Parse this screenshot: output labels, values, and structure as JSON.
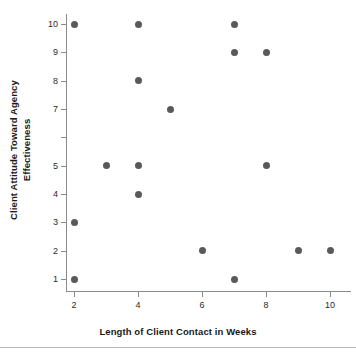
{
  "chart_data": {
    "type": "scatter",
    "title": "",
    "xlabel": "Length of Client Contact in Weeks",
    "ylabel_line1": "Client Attitude Toward Agency",
    "ylabel_line2": "Effectiveness",
    "xlim": [
      1.4,
      10.4
    ],
    "ylim": [
      0.5,
      10.4
    ],
    "xticks": [
      2,
      4,
      6,
      8,
      10
    ],
    "xtick_labels": [
      "2",
      "4",
      "6",
      "8",
      "10"
    ],
    "yticks": [
      1,
      2,
      3,
      4,
      5,
      6,
      7,
      8,
      9,
      10
    ],
    "ytick_labels": [
      "1",
      "2",
      "3",
      "4",
      "5",
      "",
      "7",
      "8",
      "9",
      "10"
    ],
    "grid": false,
    "legend": false,
    "marker_color": "#595959",
    "axis_color": "#8a8a8a",
    "points": [
      {
        "x": 2,
        "y": 10
      },
      {
        "x": 2,
        "y": 3
      },
      {
        "x": 2,
        "y": 1
      },
      {
        "x": 3,
        "y": 5
      },
      {
        "x": 4,
        "y": 10
      },
      {
        "x": 4,
        "y": 8
      },
      {
        "x": 4,
        "y": 5
      },
      {
        "x": 4,
        "y": 4
      },
      {
        "x": 5,
        "y": 7
      },
      {
        "x": 6,
        "y": 2
      },
      {
        "x": 7,
        "y": 10
      },
      {
        "x": 7,
        "y": 9
      },
      {
        "x": 7,
        "y": 1
      },
      {
        "x": 8,
        "y": 9
      },
      {
        "x": 8,
        "y": 5
      },
      {
        "x": 9,
        "y": 2
      },
      {
        "x": 10,
        "y": 2
      }
    ]
  }
}
